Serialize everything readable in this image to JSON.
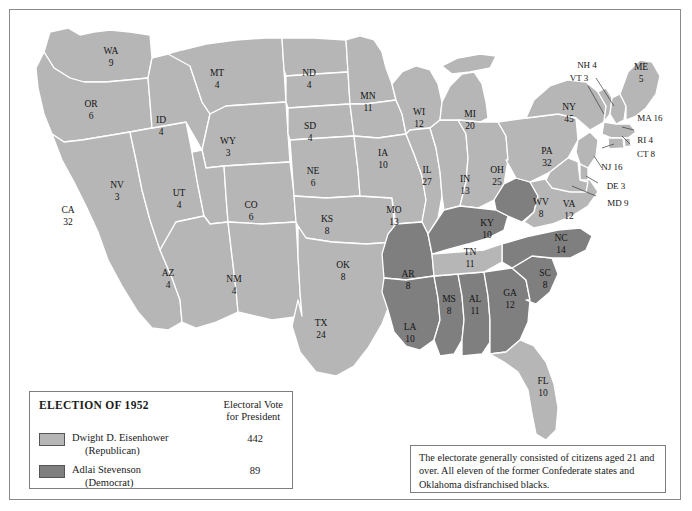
{
  "map": {
    "title": "Election of 1952 Electoral Map",
    "colors": {
      "republican": "#b6b6b6",
      "democrat": "#7f7f7f",
      "border": "#ffffff",
      "background": "#ffffff",
      "frame": "#8a8a8a"
    },
    "states": [
      {
        "code": "WA",
        "votes": "9",
        "party": "republican"
      },
      {
        "code": "OR",
        "votes": "6",
        "party": "republican"
      },
      {
        "code": "CA",
        "votes": "32",
        "party": "republican"
      },
      {
        "code": "NV",
        "votes": "3",
        "party": "republican"
      },
      {
        "code": "ID",
        "votes": "4",
        "party": "republican"
      },
      {
        "code": "MT",
        "votes": "4",
        "party": "republican"
      },
      {
        "code": "WY",
        "votes": "3",
        "party": "republican"
      },
      {
        "code": "UT",
        "votes": "4",
        "party": "republican"
      },
      {
        "code": "AZ",
        "votes": "4",
        "party": "republican"
      },
      {
        "code": "CO",
        "votes": "6",
        "party": "republican"
      },
      {
        "code": "NM",
        "votes": "4",
        "party": "republican"
      },
      {
        "code": "ND",
        "votes": "4",
        "party": "republican"
      },
      {
        "code": "SD",
        "votes": "4",
        "party": "republican"
      },
      {
        "code": "NE",
        "votes": "6",
        "party": "republican"
      },
      {
        "code": "KS",
        "votes": "8",
        "party": "republican"
      },
      {
        "code": "OK",
        "votes": "8",
        "party": "republican"
      },
      {
        "code": "TX",
        "votes": "24",
        "party": "republican"
      },
      {
        "code": "MN",
        "votes": "11",
        "party": "republican"
      },
      {
        "code": "IA",
        "votes": "10",
        "party": "republican"
      },
      {
        "code": "MO",
        "votes": "13",
        "party": "republican"
      },
      {
        "code": "AR",
        "votes": "8",
        "party": "democrat"
      },
      {
        "code": "LA",
        "votes": "10",
        "party": "democrat"
      },
      {
        "code": "MS",
        "votes": "8",
        "party": "democrat"
      },
      {
        "code": "AL",
        "votes": "11",
        "party": "democrat"
      },
      {
        "code": "GA",
        "votes": "12",
        "party": "democrat"
      },
      {
        "code": "SC",
        "votes": "8",
        "party": "democrat"
      },
      {
        "code": "NC",
        "votes": "14",
        "party": "democrat"
      },
      {
        "code": "TN",
        "votes": "11",
        "party": "republican"
      },
      {
        "code": "KY",
        "votes": "10",
        "party": "democrat"
      },
      {
        "code": "WV",
        "votes": "8",
        "party": "democrat"
      },
      {
        "code": "VA",
        "votes": "12",
        "party": "republican"
      },
      {
        "code": "FL",
        "votes": "10",
        "party": "republican"
      },
      {
        "code": "WI",
        "votes": "12",
        "party": "republican"
      },
      {
        "code": "IL",
        "votes": "27",
        "party": "republican"
      },
      {
        "code": "MI",
        "votes": "20",
        "party": "republican"
      },
      {
        "code": "IN",
        "votes": "13",
        "party": "republican"
      },
      {
        "code": "OH",
        "votes": "25",
        "party": "republican"
      },
      {
        "code": "PA",
        "votes": "32",
        "party": "republican"
      },
      {
        "code": "NY",
        "votes": "45",
        "party": "republican"
      },
      {
        "code": "ME",
        "votes": "5",
        "party": "republican"
      },
      {
        "code": "NH",
        "votes": "4",
        "party": "republican"
      },
      {
        "code": "VT",
        "votes": "3",
        "party": "republican"
      },
      {
        "code": "MA",
        "votes": "16",
        "party": "republican"
      },
      {
        "code": "RI",
        "votes": "4",
        "party": "republican"
      },
      {
        "code": "CT",
        "votes": "8",
        "party": "republican"
      },
      {
        "code": "NJ",
        "votes": "16",
        "party": "republican"
      },
      {
        "code": "DE",
        "votes": "3",
        "party": "republican"
      },
      {
        "code": "MD",
        "votes": "9",
        "party": "republican"
      }
    ]
  },
  "legend": {
    "title": "ELECTION OF 1952",
    "electoral_header_line1": "Electoral Vote",
    "electoral_header_line2": "for President",
    "entries": [
      {
        "name": "Dwight D. Eisenhower",
        "party": "(Republican)",
        "votes": "442",
        "swatch": "republican"
      },
      {
        "name": "Adlai Stevenson",
        "party": "(Democrat)",
        "votes": "89",
        "swatch": "democrat"
      }
    ]
  },
  "note": {
    "text": "The electorate generally consisted of citizens aged 21 and over. All eleven of the former Confederate states and Oklahoma disfranchised blacks."
  }
}
